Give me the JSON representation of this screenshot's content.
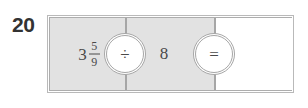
{
  "problem": {
    "number": "20",
    "type": "mixed-number-division",
    "equation_text": "3 5/9 ÷ 8 ="
  },
  "equation": {
    "cells": [
      {
        "name": "operand-1",
        "kind": "mixed-number",
        "whole": "3",
        "numerator": "5",
        "denominator": "9",
        "shaded": true
      },
      {
        "name": "operand-2",
        "kind": "whole-number",
        "value": "8",
        "shaded": true
      },
      {
        "name": "answer",
        "kind": "blank",
        "value": "",
        "shaded": false
      }
    ],
    "operators": [
      {
        "name": "divide",
        "symbol": "÷",
        "label": "division-operator"
      },
      {
        "name": "equals",
        "symbol": "=",
        "label": "equals-operator"
      }
    ]
  },
  "colors": {
    "page_background": "#ffffff",
    "cell_shaded": "#e2e2e2",
    "cell_blank": "#ffffff",
    "border": "#a6a6a6",
    "border_outer": "#b9b9b9",
    "text": "#4a4a4a",
    "number_text": "#333333"
  }
}
